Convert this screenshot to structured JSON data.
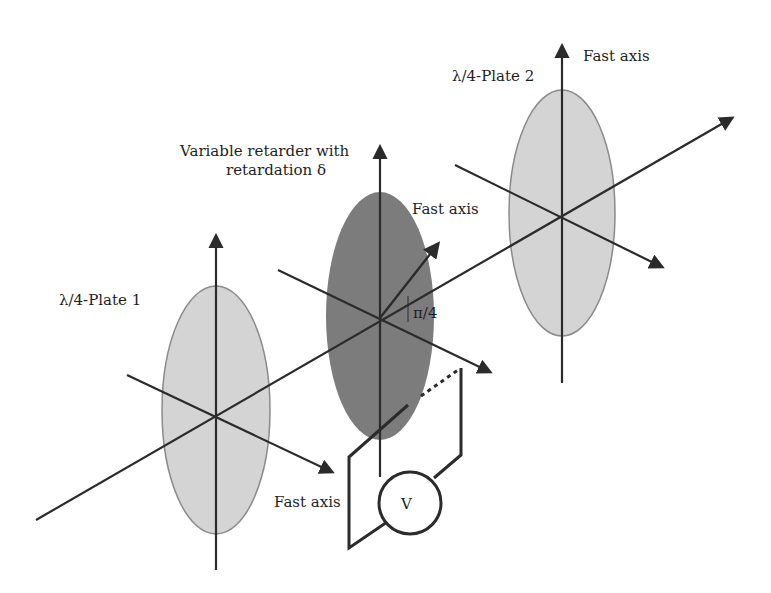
{
  "diagram": {
    "labels": {
      "plate1": "λ/4-Plate 1",
      "plate2": "λ/4-Plate 2",
      "retarder_line1": "Variable retarder with",
      "retarder_line2": "retardation δ",
      "fast_axis_plate2": "Fast axis",
      "fast_axis_retarder": "Fast axis",
      "fast_axis_plate1": "Fast axis",
      "angle": "π/4",
      "voltmeter": "V"
    },
    "colors": {
      "plate_fill": "#d4d4d4",
      "plate_stroke": "#8a8a8a",
      "retarder_fill": "#7c7c7c",
      "line": "#2b2b2b",
      "text": "#1e1e1e",
      "background": "#ffffff"
    },
    "components": [
      {
        "name": "λ/4-Plate 1",
        "type": "quarter-wave plate",
        "shade": "light"
      },
      {
        "name": "Variable retarder",
        "type": "variable retarder",
        "shade": "dark",
        "fast_axis_angle": "π/4"
      },
      {
        "name": "λ/4-Plate 2",
        "type": "quarter-wave plate",
        "shade": "light"
      }
    ]
  }
}
